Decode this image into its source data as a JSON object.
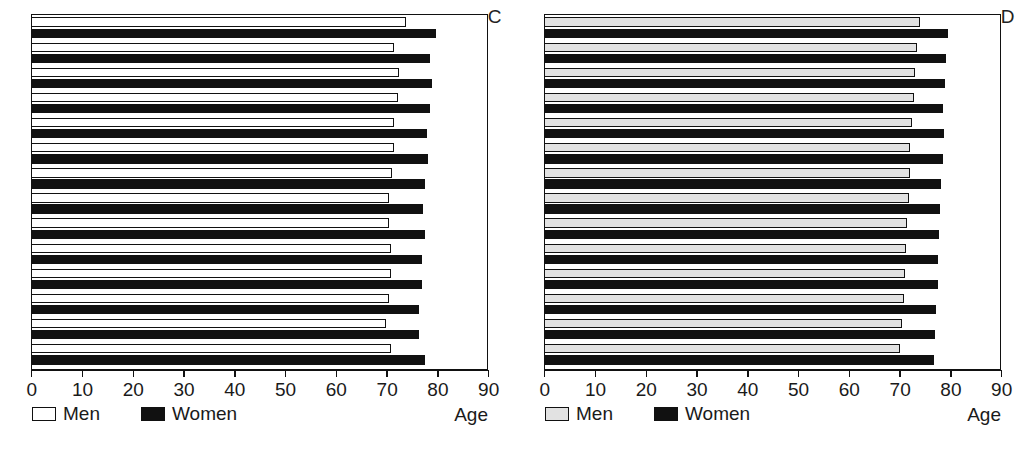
{
  "figure": {
    "panels": [
      {
        "id": "C",
        "label": "C",
        "men_fill": "#ffffff",
        "women_fill": "#111111"
      },
      {
        "id": "D",
        "label": "D",
        "men_fill": "#e2e2e2",
        "women_fill": "#111111"
      }
    ],
    "legend": {
      "men_label": "Men",
      "women_label": "Women"
    },
    "axis_title": "Age"
  },
  "chart_data": [
    {
      "type": "bar",
      "orientation": "horizontal",
      "panel": "C",
      "title": "C",
      "xlabel": "Age",
      "ylabel": "",
      "xlim": [
        0,
        90
      ],
      "ticks": [
        0,
        10,
        20,
        30,
        40,
        50,
        60,
        70,
        80,
        90
      ],
      "grid": false,
      "legend_position": "below-axis-left",
      "categories": [
        "1",
        "2",
        "3",
        "4",
        "5",
        "6",
        "7",
        "8",
        "9",
        "10",
        "11",
        "12",
        "13",
        "14"
      ],
      "series": [
        {
          "name": "Men",
          "values": [
            73.8,
            71.5,
            72.5,
            72.2,
            71.5,
            71.5,
            71.0,
            70.5,
            70.5,
            70.8,
            70.8,
            70.5,
            70.0,
            70.8
          ]
        },
        {
          "name": "Women",
          "values": [
            79.8,
            78.5,
            79.0,
            78.5,
            78.0,
            78.2,
            77.5,
            77.2,
            77.5,
            77.0,
            77.0,
            76.5,
            76.5,
            77.5
          ]
        }
      ]
    },
    {
      "type": "bar",
      "orientation": "horizontal",
      "panel": "D",
      "title": "D",
      "xlabel": "Age",
      "ylabel": "",
      "xlim": [
        0,
        90
      ],
      "ticks": [
        0,
        10,
        20,
        30,
        40,
        50,
        60,
        70,
        80,
        90
      ],
      "grid": false,
      "legend_position": "below-axis-left",
      "categories": [
        "1",
        "2",
        "3",
        "4",
        "5",
        "6",
        "7",
        "8",
        "9",
        "10",
        "11",
        "12",
        "13",
        "14"
      ],
      "series": [
        {
          "name": "Men",
          "values": [
            74.0,
            73.5,
            73.0,
            72.8,
            72.5,
            72.0,
            72.0,
            71.8,
            71.5,
            71.2,
            71.0,
            70.8,
            70.5,
            70.2
          ]
        },
        {
          "name": "Women",
          "values": [
            79.5,
            79.2,
            79.0,
            78.5,
            78.8,
            78.5,
            78.2,
            78.0,
            77.8,
            77.5,
            77.5,
            77.2,
            77.0,
            76.8
          ]
        }
      ]
    }
  ]
}
